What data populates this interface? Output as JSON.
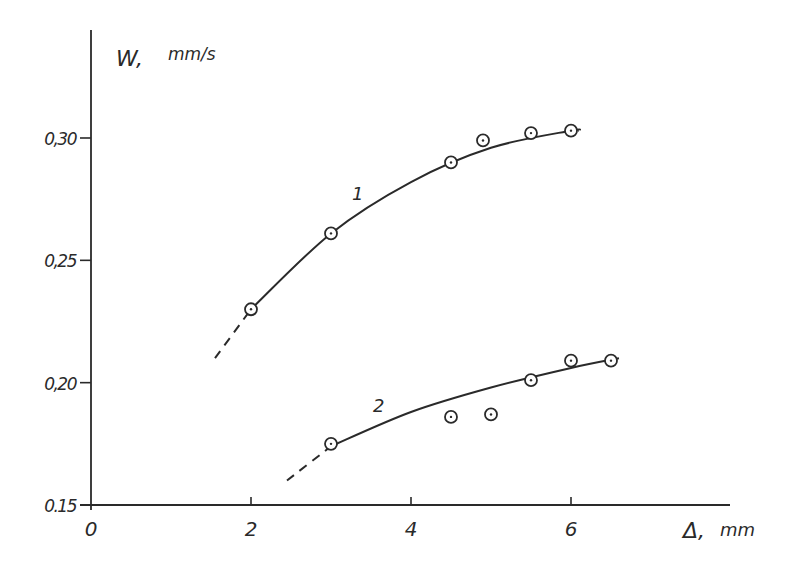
{
  "chart_data": {
    "type": "scatter",
    "title": "",
    "xlabel": "Δ, mm",
    "ylabel": "W, mm/s",
    "xlim": [
      0,
      7.8
    ],
    "ylim": [
      0.15,
      0.33
    ],
    "grid": false,
    "x_ticks": [
      "0",
      "2",
      "4",
      "6"
    ],
    "y_ticks": [
      "0.15",
      "0,20",
      "0,25",
      "0,30"
    ],
    "series": [
      {
        "name": "1",
        "points": [
          {
            "x": 2.0,
            "y": 0.23
          },
          {
            "x": 3.0,
            "y": 0.261
          },
          {
            "x": 4.5,
            "y": 0.29
          },
          {
            "x": 4.9,
            "y": 0.299
          },
          {
            "x": 5.5,
            "y": 0.302
          },
          {
            "x": 6.0,
            "y": 0.303
          }
        ],
        "fit_curve": [
          {
            "x": 2.0,
            "y": 0.23
          },
          {
            "x": 3.0,
            "y": 0.261
          },
          {
            "x": 4.0,
            "y": 0.282
          },
          {
            "x": 5.0,
            "y": 0.296
          },
          {
            "x": 6.0,
            "y": 0.303
          },
          {
            "x": 6.1,
            "y": 0.303
          }
        ],
        "extrapolation_dashed": [
          {
            "x": 1.55,
            "y": 0.21
          },
          {
            "x": 2.0,
            "y": 0.23
          }
        ]
      },
      {
        "name": "2",
        "points": [
          {
            "x": 3.0,
            "y": 0.175
          },
          {
            "x": 4.5,
            "y": 0.186
          },
          {
            "x": 5.0,
            "y": 0.187
          },
          {
            "x": 5.5,
            "y": 0.201
          },
          {
            "x": 6.0,
            "y": 0.209
          },
          {
            "x": 6.5,
            "y": 0.209
          }
        ],
        "fit_curve": [
          {
            "x": 3.0,
            "y": 0.174
          },
          {
            "x": 4.0,
            "y": 0.188
          },
          {
            "x": 5.0,
            "y": 0.198
          },
          {
            "x": 6.0,
            "y": 0.206
          },
          {
            "x": 6.6,
            "y": 0.21
          }
        ],
        "extrapolation_dashed": [
          {
            "x": 2.45,
            "y": 0.16
          },
          {
            "x": 3.0,
            "y": 0.174
          }
        ]
      }
    ],
    "annotations": [
      {
        "text": "1",
        "x": 3.8,
        "y": 0.278
      },
      {
        "text": "2",
        "x": 3.7,
        "y": 0.191
      }
    ]
  },
  "labels": {
    "y_axis": "W,",
    "y_unit": "mm/s",
    "x_axis": "Δ,",
    "x_unit": "mm",
    "curve1": "1",
    "curve2": "2"
  }
}
